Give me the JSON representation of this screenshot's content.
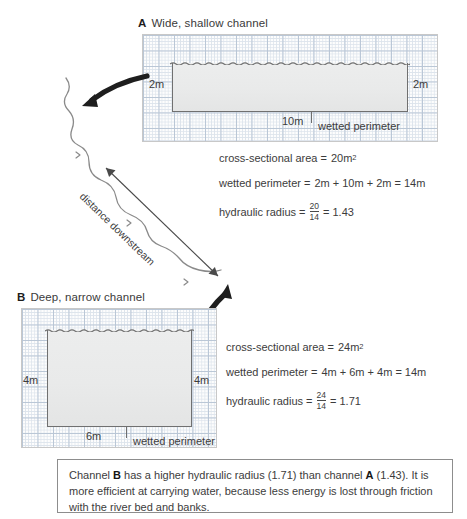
{
  "panels": {
    "a": {
      "letter": "A",
      "title": "Wide, shallow channel",
      "left_depth": "2m",
      "right_depth": "2m",
      "width_label": "10m",
      "wetted_perimeter_label": "wetted perimeter",
      "formulas": {
        "area_label": "cross-sectional area =",
        "area_value": "20m",
        "area_unit_exp": "2",
        "perimeter_label": "wetted perimeter =",
        "perimeter_value": "2m + 10m + 2m = 14m",
        "radius_label": "hydraulic radius =",
        "radius_num": "20",
        "radius_den": "14",
        "radius_value": "= 1.43"
      }
    },
    "b": {
      "letter": "B",
      "title": "Deep, narrow channel",
      "left_depth": "4m",
      "right_depth": "4m",
      "width_label": "6m",
      "wetted_perimeter_label": "wetted perimeter",
      "formulas": {
        "area_label": "cross-sectional area =",
        "area_value": "24m",
        "area_unit_exp": "2",
        "perimeter_label": "wetted perimeter =",
        "perimeter_value": "4m + 6m + 4m = 14m",
        "radius_label": "hydraulic radius =",
        "radius_num": "24",
        "radius_den": "14",
        "radius_value": "= 1.71"
      }
    }
  },
  "downstream_label": "distance downstream",
  "conclusion": {
    "part1": "Channel ",
    "bold1": "B",
    "part2": " has a higher hydraulic radius (1.71) than channel ",
    "bold2": "A",
    "part3": " (1.43). It is more efficient at carrying water, because less energy is lost through friction with the river bed and banks."
  },
  "colors": {
    "grid_minor": "#dde4ec",
    "grid_major": "#b9c6d6",
    "water_fill": "#e9eaea",
    "channel_stroke": "#707070",
    "river_stroke": "#8a8a8a",
    "arrow_fill": "#1e1e1e",
    "text": "#3c3c3c"
  }
}
